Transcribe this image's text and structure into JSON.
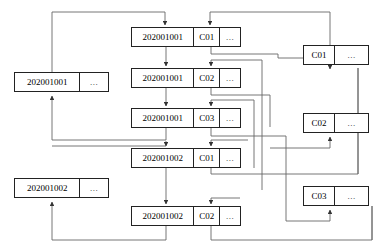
{
  "diagram": {
    "type": "node-link-diagram",
    "colors": {
      "node_border": "#222222",
      "node_fill": "#ffffff",
      "wire": "#555555",
      "text": "#000000",
      "background": "#ffffff"
    },
    "ellipsis": "...",
    "left_column": {
      "name": "document-id-nodes",
      "nodes": [
        {
          "id": "doc-1",
          "key": "202001001",
          "dots": "...",
          "x": 14,
          "y": 72,
          "w": 95,
          "h": 20,
          "key_w": 65
        },
        {
          "id": "doc-2",
          "key": "202001002",
          "dots": "...",
          "x": 14,
          "y": 178,
          "w": 95,
          "h": 20,
          "key_w": 65
        }
      ]
    },
    "center_column": {
      "name": "posting-entry-nodes",
      "nodes": [
        {
          "id": "post-1",
          "key": "202001001",
          "code": "C01",
          "dots": "...",
          "x": 131,
          "y": 27,
          "w": 110,
          "h": 20,
          "key_w": 62,
          "code_w": 26
        },
        {
          "id": "post-2",
          "key": "202001001",
          "code": "C02",
          "dots": "...",
          "x": 131,
          "y": 68,
          "w": 110,
          "h": 20,
          "key_w": 62,
          "code_w": 26
        },
        {
          "id": "post-3",
          "key": "202001001",
          "code": "C03",
          "dots": "...",
          "x": 131,
          "y": 108,
          "w": 110,
          "h": 20,
          "key_w": 62,
          "code_w": 26
        },
        {
          "id": "post-4",
          "key": "202001002",
          "code": "C01",
          "dots": "...",
          "x": 131,
          "y": 148,
          "w": 110,
          "h": 20,
          "key_w": 62,
          "code_w": 26
        },
        {
          "id": "post-5",
          "key": "202001002",
          "code": "C02",
          "dots": "...",
          "x": 131,
          "y": 206,
          "w": 110,
          "h": 20,
          "key_w": 62,
          "code_w": 26
        }
      ]
    },
    "right_column": {
      "name": "category-code-nodes",
      "nodes": [
        {
          "id": "cat-1",
          "code": "C01",
          "dots": "...",
          "x": 303,
          "y": 45,
          "w": 66,
          "h": 20,
          "code_w": 30
        },
        {
          "id": "cat-2",
          "code": "C02",
          "dots": "...",
          "x": 303,
          "y": 113,
          "w": 66,
          "h": 20,
          "code_w": 30
        },
        {
          "id": "cat-3",
          "code": "C03",
          "dots": "...",
          "x": 303,
          "y": 186,
          "w": 66,
          "h": 20,
          "code_w": 30
        }
      ]
    }
  }
}
